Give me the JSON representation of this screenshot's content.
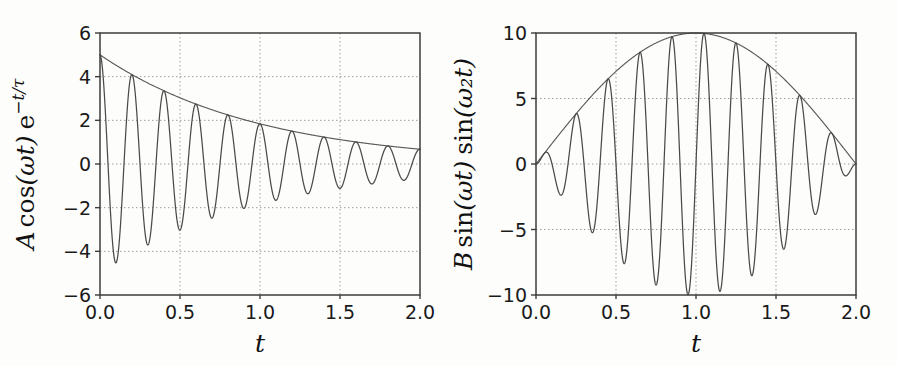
{
  "figure": {
    "background_color": "#fdfdfc",
    "curve_color": "#4a4a4a",
    "grid_color": "#999999",
    "frame_color": "#3c3c3c"
  },
  "chart_data": [
    {
      "type": "line",
      "panel": "left",
      "title": "",
      "xlabel": "t",
      "ylabel": "A cos(ωt) e−t/τ",
      "ylabel_parts": {
        "amplitude": "A",
        "cos": "cos",
        "omega_t": "(ωt)",
        "exp": "e",
        "exp_sup": "−t/τ"
      },
      "xlim": [
        0.0,
        2.0
      ],
      "ylim": [
        -6,
        6
      ],
      "xticks": [
        0.0,
        0.5,
        1.0,
        1.5,
        2.0
      ],
      "xtick_labels": [
        "0.0",
        "0.5",
        "1.0",
        "1.5",
        "2.0"
      ],
      "yticks": [
        -6,
        -4,
        -2,
        0,
        2,
        4,
        6
      ],
      "ytick_labels": [
        "−6",
        "−4",
        "−2",
        "0",
        "2",
        "4",
        "6"
      ],
      "grid": true,
      "grid_style": "dotted",
      "legend": "none",
      "params": {
        "A": 5,
        "omega": 31.4159,
        "period": 0.2,
        "tau": 1.0
      },
      "series": [
        {
          "name": "damped oscillation",
          "formula": "A*cos(omega*t)*exp(-t/tau)",
          "sample_points": [
            {
              "x": 0.0,
              "y": 5.0
            },
            {
              "x": 0.1,
              "y": -4.52
            },
            {
              "x": 0.2,
              "y": 4.09
            },
            {
              "x": 0.3,
              "y": -3.7
            },
            {
              "x": 0.4,
              "y": 3.35
            },
            {
              "x": 0.5,
              "y": -3.03
            },
            {
              "x": 0.6,
              "y": 2.74
            },
            {
              "x": 0.7,
              "y": -2.48
            },
            {
              "x": 0.8,
              "y": 2.25
            },
            {
              "x": 0.9,
              "y": -2.03
            },
            {
              "x": 1.0,
              "y": 1.84
            },
            {
              "x": 1.1,
              "y": -1.66
            },
            {
              "x": 1.2,
              "y": 1.51
            },
            {
              "x": 1.3,
              "y": -1.36
            },
            {
              "x": 1.4,
              "y": 1.23
            },
            {
              "x": 1.5,
              "y": -1.12
            },
            {
              "x": 1.6,
              "y": 1.01
            },
            {
              "x": 1.7,
              "y": -0.91
            },
            {
              "x": 1.8,
              "y": 0.83
            },
            {
              "x": 1.9,
              "y": -0.75
            },
            {
              "x": 2.0,
              "y": 0.68
            }
          ]
        },
        {
          "name": "decay envelope",
          "formula": "A*exp(-t/tau)",
          "sample_points": [
            {
              "x": 0.0,
              "y": 5.0
            },
            {
              "x": 0.25,
              "y": 3.89
            },
            {
              "x": 0.5,
              "y": 3.03
            },
            {
              "x": 0.75,
              "y": 2.36
            },
            {
              "x": 1.0,
              "y": 1.84
            },
            {
              "x": 1.25,
              "y": 1.43
            },
            {
              "x": 1.5,
              "y": 1.12
            },
            {
              "x": 1.75,
              "y": 0.87
            },
            {
              "x": 2.0,
              "y": 0.68
            }
          ]
        }
      ]
    },
    {
      "type": "line",
      "panel": "right",
      "title": "",
      "xlabel": "t",
      "ylabel": "B sin(ωt) sin(ω₂t)",
      "ylabel_parts": {
        "amplitude": "B",
        "sin1": "sin",
        "omega_t": "(ωt)",
        "sin2": "sin",
        "omega2_t": "(ω₂t)"
      },
      "xlim": [
        0.0,
        2.0
      ],
      "ylim": [
        -10,
        10
      ],
      "xticks": [
        0.0,
        0.5,
        1.0,
        1.5,
        2.0
      ],
      "xtick_labels": [
        "0.0",
        "0.5",
        "1.0",
        "1.5",
        "2.0"
      ],
      "yticks": [
        -10,
        -5,
        0,
        5,
        10
      ],
      "ytick_labels": [
        "−10",
        "−5",
        "0",
        "5",
        "10"
      ],
      "grid": true,
      "grid_style": "dotted",
      "legend": "none",
      "params": {
        "B": 10,
        "omega": 31.4159,
        "omega_2": 1.5708,
        "fast_period": 0.2,
        "envelope_period": 4.0
      },
      "series": [
        {
          "name": "beat modulated wave",
          "formula": "B*sin(omega*t)*sin(omega_2*t)",
          "sample_points": [
            {
              "x": 0.0,
              "y": 0.0
            },
            {
              "x": 0.15,
              "y": -2.3
            },
            {
              "x": 0.25,
              "y": 3.8
            },
            {
              "x": 0.35,
              "y": -5.2
            },
            {
              "x": 0.45,
              "y": 6.3
            },
            {
              "x": 0.55,
              "y": -7.4
            },
            {
              "x": 0.65,
              "y": 8.2
            },
            {
              "x": 0.75,
              "y": -9.1
            },
            {
              "x": 0.85,
              "y": 9.6
            },
            {
              "x": 0.95,
              "y": -9.9
            },
            {
              "x": 1.05,
              "y": 9.9
            },
            {
              "x": 1.15,
              "y": -9.7
            },
            {
              "x": 1.25,
              "y": 9.2
            },
            {
              "x": 1.35,
              "y": -8.9
            },
            {
              "x": 1.45,
              "y": 7.7
            },
            {
              "x": 1.55,
              "y": -6.8
            },
            {
              "x": 1.65,
              "y": 5.2
            },
            {
              "x": 1.75,
              "y": -4.5
            },
            {
              "x": 1.85,
              "y": 2.6
            },
            {
              "x": 1.95,
              "y": -1.6
            },
            {
              "x": 2.0,
              "y": 0.0
            }
          ]
        },
        {
          "name": "beat envelope",
          "formula": "B*sin(omega_2*t)",
          "sample_points": [
            {
              "x": 0.0,
              "y": 0.0
            },
            {
              "x": 0.25,
              "y": 3.83
            },
            {
              "x": 0.5,
              "y": 7.07
            },
            {
              "x": 0.75,
              "y": 9.24
            },
            {
              "x": 1.0,
              "y": 10.0
            },
            {
              "x": 1.25,
              "y": 9.24
            },
            {
              "x": 1.5,
              "y": 7.07
            },
            {
              "x": 1.75,
              "y": 3.83
            },
            {
              "x": 2.0,
              "y": 0.0
            }
          ]
        }
      ]
    }
  ]
}
